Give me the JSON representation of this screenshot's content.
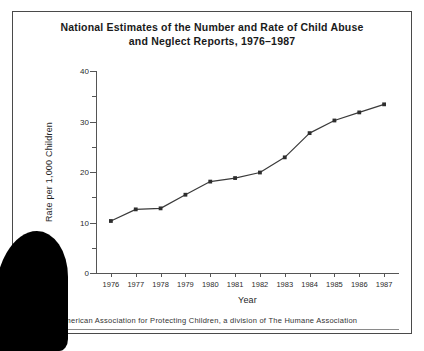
{
  "figure": {
    "title_line_1": "National Estimates of the Number and Rate of Child Abuse",
    "title_line_2": "and Neglect Reports, 1976–1987",
    "source_note": ": American Association for Protecting Children, a division of The Humane Association",
    "border_color": "#4a4a4a",
    "line_color": "#3a3a3a",
    "marker_color": "#2e2e2e",
    "background": "#ffffff"
  },
  "chart_data": {
    "type": "line",
    "xlabel": "Year",
    "ylabel": "Rate per 1,000 Children",
    "categories": [
      "1976",
      "1977",
      "1978",
      "1979",
      "1980",
      "1981",
      "1982",
      "1983",
      "1984",
      "1985",
      "1986",
      "1987"
    ],
    "x": [
      1976,
      1977,
      1978,
      1979,
      1980,
      1981,
      1982,
      1983,
      1984,
      1985,
      1986,
      1987
    ],
    "series": [
      {
        "name": "Rate per 1,000 Children",
        "values": [
          10.3,
          12.6,
          12.8,
          15.5,
          18.1,
          18.8,
          19.9,
          22.9,
          27.7,
          30.2,
          31.8,
          33.4
        ]
      }
    ],
    "ylim": [
      0,
      40
    ],
    "ytick_labels": [
      "0",
      "10",
      "20",
      "30",
      "40"
    ],
    "ytick_values": [
      0,
      10,
      20,
      30,
      40
    ],
    "yminor_values": [
      5,
      15,
      25,
      35
    ],
    "xlim": [
      1975.5,
      1987.5
    ],
    "grid": false,
    "legend": "none",
    "marker": "square"
  }
}
